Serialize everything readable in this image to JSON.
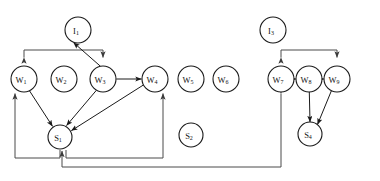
{
  "diagram": {
    "title": "",
    "colors": {
      "node_stroke": "#1a1a1a",
      "node_fill": "#ffffff",
      "edge": "#1a1a1a",
      "route_edge": "#4a4a4a",
      "background": "#ffffff"
    },
    "nodes": [
      {
        "id": "I1",
        "base": "I",
        "sub": "1",
        "label": "I 1",
        "cx": 78,
        "cy": 30,
        "r": 13,
        "type": "input",
        "isolated": false
      },
      {
        "id": "I3",
        "base": "I",
        "sub": "3",
        "label": "I 3",
        "cx": 273,
        "cy": 30,
        "r": 13,
        "type": "input",
        "isolated": true
      },
      {
        "id": "W1",
        "base": "W",
        "sub": "1",
        "label": "W 1",
        "cx": 24,
        "cy": 79,
        "r": 13,
        "type": "worker",
        "isolated": false
      },
      {
        "id": "W2",
        "base": "W",
        "sub": "2",
        "label": "W 2",
        "cx": 64,
        "cy": 79,
        "r": 13,
        "type": "worker",
        "isolated": true
      },
      {
        "id": "W3",
        "base": "W",
        "sub": "3",
        "label": "W 3",
        "cx": 103,
        "cy": 79,
        "r": 13,
        "type": "worker",
        "isolated": false
      },
      {
        "id": "W4",
        "base": "W",
        "sub": "4",
        "label": "W 4",
        "cx": 155,
        "cy": 79,
        "r": 13,
        "type": "worker",
        "isolated": false
      },
      {
        "id": "W5",
        "base": "W",
        "sub": "5",
        "label": "W 5",
        "cx": 191,
        "cy": 79,
        "r": 13,
        "type": "worker",
        "isolated": true
      },
      {
        "id": "W6",
        "base": "W",
        "sub": "6",
        "label": "W 6",
        "cx": 226,
        "cy": 79,
        "r": 13,
        "type": "worker",
        "isolated": true
      },
      {
        "id": "W7",
        "base": "W",
        "sub": "7",
        "label": "W 7",
        "cx": 281,
        "cy": 79,
        "r": 13,
        "type": "worker",
        "isolated": false
      },
      {
        "id": "W8",
        "base": "W",
        "sub": "8",
        "label": "W 8",
        "cx": 309,
        "cy": 79,
        "r": 13,
        "type": "worker",
        "isolated": false
      },
      {
        "id": "W9",
        "base": "W",
        "sub": "9",
        "label": "W 9",
        "cx": 337,
        "cy": 79,
        "r": 13,
        "type": "worker",
        "isolated": false
      },
      {
        "id": "S1",
        "base": "S",
        "sub": "1",
        "label": "S 1",
        "cx": 60,
        "cy": 137,
        "r": 12,
        "type": "server",
        "isolated": false
      },
      {
        "id": "S2",
        "base": "S",
        "sub": "2",
        "label": "S 2",
        "cx": 191,
        "cy": 135,
        "r": 12,
        "type": "server",
        "isolated": true
      },
      {
        "id": "S4",
        "base": "S",
        "sub": "4",
        "label": "S 4",
        "cx": 310,
        "cy": 134,
        "r": 12,
        "type": "server",
        "isolated": false
      }
    ],
    "edges": [
      {
        "name": "edge-w3-i1",
        "from": "W3",
        "to": "I1",
        "arrows": "both",
        "style": "straight"
      },
      {
        "name": "edge-w3-w4",
        "from": "W3",
        "to": "W4",
        "arrows": "both",
        "style": "straight"
      },
      {
        "name": "edge-w1-s1",
        "from": "W1",
        "to": "S1",
        "arrows": "both",
        "style": "straight"
      },
      {
        "name": "edge-w3-s1",
        "from": "W3",
        "to": "S1",
        "arrows": "both",
        "style": "straight"
      },
      {
        "name": "edge-w4-s1",
        "from": "W4",
        "to": "S1",
        "arrows": "both",
        "style": "straight"
      },
      {
        "name": "edge-w7-w8",
        "from": "W7",
        "to": "W8",
        "arrows": "both",
        "style": "straight"
      },
      {
        "name": "edge-w8-w9",
        "from": "W8",
        "to": "W9",
        "arrows": "both",
        "style": "straight"
      },
      {
        "name": "edge-w8-s4",
        "from": "W8",
        "to": "S4",
        "arrows": "both",
        "style": "straight"
      },
      {
        "name": "edge-w9-s4",
        "from": "W9",
        "to": "S4",
        "arrows": "both",
        "style": "straight"
      },
      {
        "name": "bracket-w1-w3",
        "from": "bus",
        "to": "W1,W3",
        "arrows": "down-both",
        "style": "orthogonal-top"
      },
      {
        "name": "bracket-w7-w9",
        "from": "bus",
        "to": "W7,W9",
        "arrows": "down-both",
        "style": "orthogonal-top"
      },
      {
        "name": "route-s1-w1",
        "from": "S1",
        "to": "W1",
        "arrows": "up",
        "style": "orthogonal-bottom-left"
      },
      {
        "name": "route-s1-w4",
        "from": "S1",
        "to": "W4",
        "arrows": "up",
        "style": "orthogonal-bottom-right"
      },
      {
        "name": "route-w7-s1",
        "from": "W7",
        "to": "S1",
        "arrows": "up",
        "style": "orthogonal-bottom-long"
      }
    ],
    "counts": {
      "nodes": 14,
      "inputs": 2,
      "workers": 9,
      "servers": 3
    }
  }
}
